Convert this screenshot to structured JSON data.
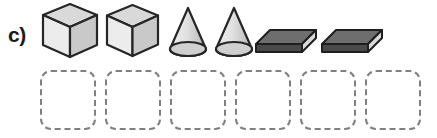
{
  "exercise": {
    "label": "c)",
    "type": "count-and-group-solids-worksheet"
  },
  "colors": {
    "background": "#ffffff",
    "label_text": "#1a1a1a",
    "dashed_border": "#808080",
    "cube_top": "#d9d9d9",
    "cube_left": "#ececec",
    "cube_right": "#c9c9c9",
    "cube_outline": "#262626",
    "cone_body_light": "#e8e8e8",
    "cone_body_dark": "#b8b8b8",
    "cone_base": "#d0d0d0",
    "cone_outline": "#262626",
    "slab_top": "#6e6e6e",
    "slab_front": "#4a4a4a",
    "slab_side": "#d8d8d8",
    "slab_outline": "#1f1f1f"
  },
  "shapes": [
    {
      "index": 1,
      "name": "cube",
      "label": "Cube",
      "size": "large",
      "color_family": "light-gray",
      "x": 40,
      "width": 60,
      "height": 58
    },
    {
      "index": 2,
      "name": "cube",
      "label": "Cube",
      "size": "large",
      "color_family": "light-gray",
      "x": 104,
      "width": 56,
      "height": 55
    },
    {
      "index": 3,
      "name": "cone",
      "label": "Cone",
      "size": "medium",
      "color_family": "light-gray",
      "x": 166,
      "width": 44,
      "height": 52
    },
    {
      "index": 4,
      "name": "cone",
      "label": "Cone",
      "size": "medium",
      "color_family": "light-gray",
      "x": 212,
      "width": 44,
      "height": 52
    },
    {
      "index": 5,
      "name": "rectangular-prism",
      "label": "Rectangular prism",
      "size": "flat-slab",
      "color_family": "dark-gray",
      "x": 254,
      "width": 62,
      "height": 28
    },
    {
      "index": 6,
      "name": "rectangular-prism",
      "label": "Rectangular prism",
      "size": "flat-slab",
      "color_family": "dark-gray",
      "x": 320,
      "width": 62,
      "height": 28
    }
  ],
  "answer_boxes": [
    {
      "index": 1,
      "value": "",
      "x": 40
    },
    {
      "index": 2,
      "value": "",
      "x": 105
    },
    {
      "index": 3,
      "value": "",
      "x": 170
    },
    {
      "index": 4,
      "value": "",
      "x": 235
    },
    {
      "index": 5,
      "value": "",
      "x": 300
    },
    {
      "index": 6,
      "value": "",
      "x": 365
    }
  ]
}
